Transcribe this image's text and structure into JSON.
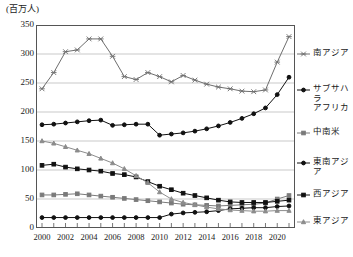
{
  "unit_label": "(百万人)",
  "axis": {
    "y_ticks": [
      "0",
      "50",
      "100",
      "150",
      "200",
      "250",
      "300",
      "350"
    ],
    "x_ticks": [
      "2000",
      "2002",
      "2004",
      "2006",
      "2008",
      "2010",
      "2012",
      "2014",
      "2016",
      "2018",
      "2020"
    ]
  },
  "legend": {
    "items": [
      {
        "label": "南アジア",
        "marker": "star-marker",
        "color": "#6e6e6e"
      },
      {
        "label": "サブサハラ\nアフリカ",
        "marker": "diamond-marker",
        "color": "#111111"
      },
      {
        "label": "中南米",
        "marker": "square-marker",
        "color": "#7a7a7a"
      },
      {
        "label": "東南アジア",
        "marker": "circle-marker",
        "color": "#111111"
      },
      {
        "label": "西アジア",
        "marker": "square-filled-marker",
        "color": "#111111"
      },
      {
        "label": "東アジア",
        "marker": "triangle-marker",
        "color": "#8c8c8c"
      }
    ]
  },
  "chart_data": {
    "type": "line",
    "title": "",
    "xlabel": "",
    "ylabel": "百万人",
    "ylim": [
      0,
      350
    ],
    "ytick_step": 50,
    "grid": true,
    "legend_position": "right",
    "x": [
      2000,
      2001,
      2002,
      2003,
      2004,
      2005,
      2006,
      2007,
      2008,
      2009,
      2010,
      2011,
      2012,
      2013,
      2014,
      2015,
      2016,
      2017,
      2018,
      2019,
      2020,
      2021
    ],
    "series": [
      {
        "name": "南アジア",
        "color": "#6e6e6e",
        "marker": "star",
        "values": [
          240,
          268,
          304,
          307,
          326,
          326,
          296,
          261,
          256,
          268,
          261,
          252,
          263,
          255,
          248,
          243,
          240,
          236,
          235,
          238,
          286,
          330
        ]
      },
      {
        "name": "サブサハラアフリカ",
        "color": "#111111",
        "marker": "diamond",
        "values": [
          178,
          179,
          181,
          183,
          185,
          186,
          177,
          178,
          179,
          179,
          160,
          162,
          164,
          167,
          171,
          176,
          182,
          189,
          197,
          207,
          230,
          260
        ]
      },
      {
        "name": "中南米",
        "color": "#7a7a7a",
        "marker": "square",
        "values": [
          57,
          57,
          58,
          59,
          57,
          55,
          53,
          51,
          49,
          47,
          45,
          43,
          41,
          40,
          39,
          38,
          39,
          40,
          41,
          43,
          50,
          56
        ]
      },
      {
        "name": "東南アジア",
        "color": "#111111",
        "marker": "circle",
        "values": [
          18,
          18,
          18,
          18,
          18,
          18,
          18,
          18,
          18,
          18,
          18,
          24,
          26,
          27,
          28,
          30,
          33,
          34,
          35,
          35,
          37,
          38
        ]
      },
      {
        "name": "西アジア",
        "color": "#111111",
        "marker": "square-filled",
        "values": [
          108,
          110,
          105,
          102,
          100,
          98,
          94,
          92,
          88,
          80,
          72,
          66,
          60,
          56,
          52,
          48,
          45,
          44,
          44,
          44,
          46,
          48
        ]
      },
      {
        "name": "東アジア",
        "color": "#8c8c8c",
        "marker": "triangle",
        "values": [
          150,
          146,
          140,
          134,
          128,
          120,
          112,
          102,
          90,
          78,
          62,
          50,
          44,
          40,
          36,
          33,
          31,
          30,
          29,
          29,
          30,
          30
        ]
      }
    ]
  }
}
